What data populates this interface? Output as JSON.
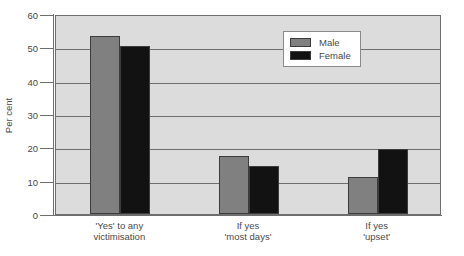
{
  "chart_data": {
    "type": "bar",
    "title": "",
    "xlabel": "",
    "ylabel": "Per cent",
    "ylim": [
      0,
      60
    ],
    "yticks": [
      0,
      10,
      20,
      30,
      40,
      50,
      60
    ],
    "grid": true,
    "legend_position": "top-right-inside",
    "categories": [
      "'Yes' to any victimisation",
      "If yes 'most days'",
      "If yes 'upset'"
    ],
    "category_lines": [
      [
        "'Yes' to any",
        "victimisation"
      ],
      [
        "If yes",
        "'most days'"
      ],
      [
        "If yes",
        "'upset'"
      ]
    ],
    "series": [
      {
        "name": "Male",
        "color": "#808080",
        "values": [
          53.5,
          17.5,
          11.0
        ]
      },
      {
        "name": "Female",
        "color": "#121212",
        "values": [
          50.5,
          14.5,
          19.5
        ]
      }
    ]
  },
  "colors": {
    "male": "#808080",
    "female": "#121212",
    "plot_background": "#dcdcdc",
    "axis": "#6e6e6e",
    "text": "#4a4a4a",
    "legend_background": "#ffffff"
  }
}
